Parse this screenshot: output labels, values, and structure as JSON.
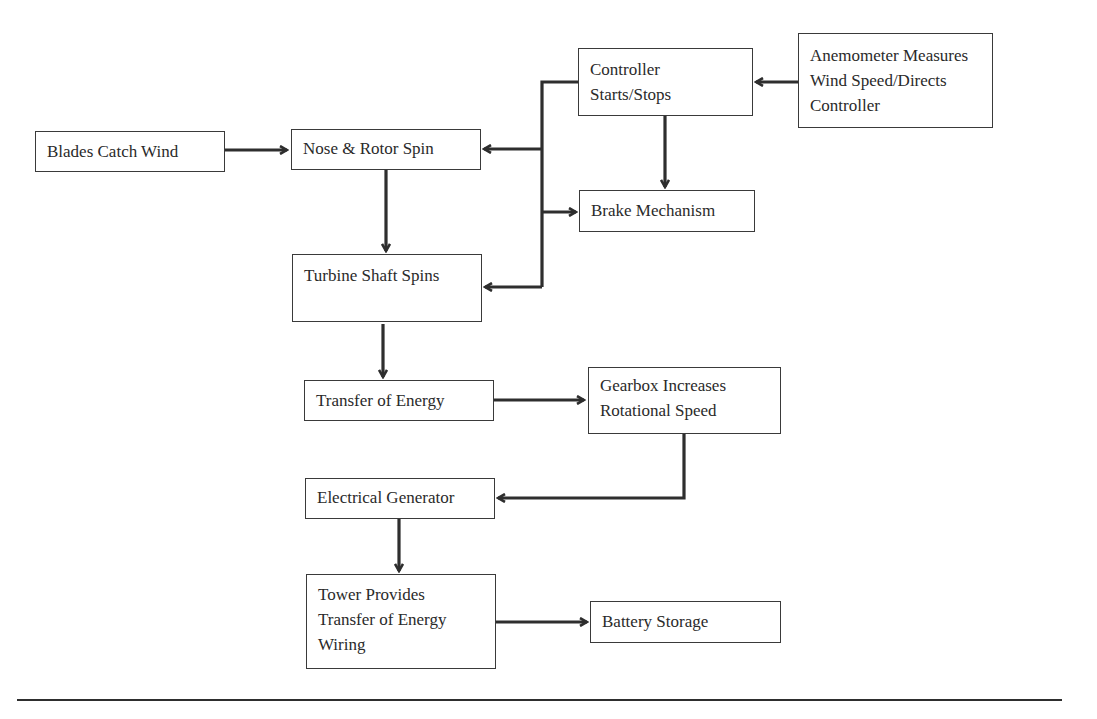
{
  "diagram": {
    "title": "",
    "nodes": [
      {
        "id": "blades",
        "lines": [
          "Blades Catch Wind"
        ]
      },
      {
        "id": "nose",
        "lines": [
          "Nose & Rotor Spin"
        ]
      },
      {
        "id": "turbine",
        "lines": [
          "Turbine Shaft Spins"
        ]
      },
      {
        "id": "controller",
        "lines": [
          "Controller",
          "Starts/Stops"
        ]
      },
      {
        "id": "brake",
        "lines": [
          "Brake Mechanism"
        ]
      },
      {
        "id": "anemometer",
        "lines": [
          "Anemometer Measures",
          "Wind Speed/Directs",
          "Controller"
        ]
      },
      {
        "id": "transfer",
        "lines": [
          "Transfer of Energy"
        ]
      },
      {
        "id": "gearbox",
        "lines": [
          "Gearbox Increases",
          "Rotational Speed"
        ]
      },
      {
        "id": "generator",
        "lines": [
          "Electrical Generator"
        ]
      },
      {
        "id": "tower",
        "lines": [
          "Tower Provides",
          "Transfer of Energy",
          "Wiring"
        ]
      },
      {
        "id": "battery",
        "lines": [
          "Battery Storage"
        ]
      }
    ],
    "edges": [
      {
        "from": "blades",
        "to": "nose"
      },
      {
        "from": "anemometer",
        "to": "controller"
      },
      {
        "from": "controller",
        "to": "nose"
      },
      {
        "from": "controller",
        "to": "brake"
      },
      {
        "from": "controller",
        "to": "turbine"
      },
      {
        "from": "nose",
        "to": "turbine"
      },
      {
        "from": "turbine",
        "to": "transfer"
      },
      {
        "from": "transfer",
        "to": "gearbox"
      },
      {
        "from": "gearbox",
        "to": "generator"
      },
      {
        "from": "generator",
        "to": "tower"
      },
      {
        "from": "tower",
        "to": "battery"
      }
    ],
    "colors": {
      "stroke": "#2e2e2e",
      "box_border": "#3a3a3a",
      "text": "#2a2a2a",
      "background": "#ffffff"
    }
  }
}
